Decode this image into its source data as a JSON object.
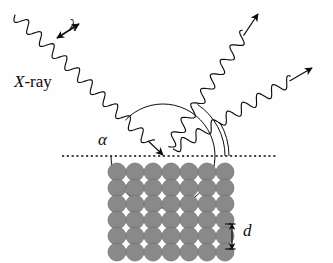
{
  "figure": {
    "type": "physics-diagram",
    "background_color": "#fefefe",
    "ink_color": "#0d0d0d"
  },
  "labels": {
    "xray": {
      "italic_part": "X",
      "rest": "-ray"
    },
    "wavelength": "λ",
    "angle": "α",
    "spacing": "d"
  },
  "rays": {
    "incident": {
      "name": "incident-xray-wave",
      "start": [
        15,
        15
      ],
      "end": [
        163,
        155
      ],
      "wave": true,
      "arrow": "at-end"
    },
    "reflected_primary": {
      "name": "reflected-xray-wave-upper",
      "start": [
        163,
        155
      ],
      "end": [
        258,
        14
      ],
      "wave": true,
      "arrow": "at-end"
    },
    "reflected_secondary": {
      "name": "reflected-xray-wave-lower",
      "start": [
        163,
        155
      ],
      "end": [
        312,
        68
      ],
      "wave": true,
      "arrow": "at-end"
    }
  },
  "surface": {
    "name": "crystal-surface-dotted-line",
    "y": 156,
    "x_start": 62,
    "x_end": 278,
    "style": "dotted"
  },
  "lattice": {
    "name": "crystal-atom-lattice",
    "columns": 7,
    "rows": 6,
    "atom_color": "#898989",
    "atom_edge_color": "#6f6f6f",
    "atom_radius": 9,
    "x_start": 117,
    "y_start": 172,
    "x_step": 18,
    "y_step": 16
  },
  "annotations": {
    "wavelength_arrow": {
      "name": "wavelength-measure-arrow",
      "x1": 57,
      "y1": 38,
      "x2": 79,
      "y2": 24,
      "double_headed": true
    },
    "spacing_arrow": {
      "name": "interplanar-spacing-arrow",
      "x": 232,
      "y1": 224,
      "y2": 249,
      "double_headed": true
    },
    "angle_arc": {
      "name": "incidence-angle-arc",
      "vertex": [
        163,
        156
      ],
      "radius": 50
    },
    "angle_arcs_right": {
      "name": "reflection-angle-arcs",
      "count": 2
    }
  },
  "chart_data": {
    "type": "diagram",
    "elements": [
      "incident X-ray wave labelled X-ray with wavelength λ",
      "glancing angle α between incident ray and crystal surface",
      "two reflected X-ray waves leaving the surface",
      "crystal lattice of 7 by 6 atoms with interplanar spacing d"
    ]
  }
}
